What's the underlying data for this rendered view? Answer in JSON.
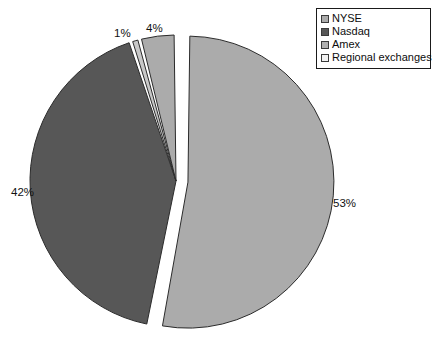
{
  "chart_data": {
    "type": "pie",
    "title": "",
    "subtitle": "",
    "xlabel": "",
    "ylabel": "",
    "grid": false,
    "legend_position": "top-right",
    "label_suffix": "%",
    "slices": [
      {
        "name": "NYSE",
        "value": 53,
        "label": "53%",
        "color": "#ababab",
        "exploded": true
      },
      {
        "name": "Nasdaq",
        "value": 42,
        "label": "42%",
        "color": "#575757",
        "exploded": false
      },
      {
        "name": "Amex",
        "value": 1,
        "label": "1%",
        "color": "#c8c8c8",
        "exploded": false
      },
      {
        "name": "Regional exchanges",
        "value": 4,
        "label": "4%",
        "color": "#ababab",
        "exploded": false
      }
    ],
    "categories": [
      "NYSE",
      "Nasdaq",
      "Amex",
      "Regional exchanges"
    ],
    "values": [
      53,
      42,
      1,
      4
    ],
    "colors": [
      "#ababab",
      "#575757",
      "#c8c8c8",
      "#ababab"
    ],
    "total": 100
  },
  "legend": {
    "items": [
      {
        "label": "NYSE",
        "color": "#ababab"
      },
      {
        "label": "Nasdaq",
        "color": "#575757"
      },
      {
        "label": "Amex",
        "color": "#b0b0b0"
      },
      {
        "label": "Regional exchanges",
        "color": "#f2f2f2"
      }
    ]
  },
  "labels": {
    "nyse": "53%",
    "nasdaq": "42%",
    "amex": "1%",
    "regional": "4%"
  },
  "style": {
    "background": "#ffffff",
    "outline": "#2b2b2b",
    "text": "#0d0d0d"
  }
}
